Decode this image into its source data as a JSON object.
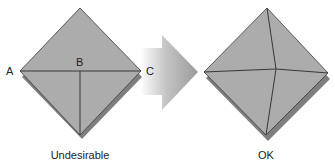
{
  "figure": {
    "left_panel": {
      "caption": "Undesirable",
      "point_labels": {
        "a": "A",
        "b": "B",
        "c": "C"
      }
    },
    "right_panel": {
      "caption": "OK"
    },
    "arrow": {
      "direction": "right"
    },
    "colors": {
      "face": "#acacac",
      "shadow": "#7a7a7a",
      "edge": "#333333",
      "arrow_dark": "#9e9e9e",
      "arrow_light": "#ffffff"
    }
  }
}
